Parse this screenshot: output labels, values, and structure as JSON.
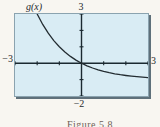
{
  "figure": {
    "caption": "Figure 5.8"
  },
  "chart_data": {
    "type": "line",
    "function_label": "g(x)",
    "xlim": [
      -3,
      3
    ],
    "ylim": [
      -2,
      3
    ],
    "window_labels": {
      "top": "3",
      "bottom": "−2",
      "left": "−3",
      "right": "3"
    },
    "grid": false,
    "legend": "none",
    "series": [
      {
        "name": "g",
        "x": [
          -2,
          -1.75,
          -1.5,
          -1.25,
          -1,
          -0.75,
          -0.5,
          -0.25,
          0,
          0.25,
          0.5,
          0.75,
          1,
          1.25,
          1.5,
          1.75,
          2,
          2.25,
          2.5,
          2.75,
          3
        ],
        "y": [
          3,
          2.364,
          1.828,
          1.378,
          1,
          0.682,
          0.414,
          0.189,
          0,
          -0.159,
          -0.293,
          -0.405,
          -0.5,
          -0.58,
          -0.646,
          -0.703,
          -0.75,
          -0.79,
          -0.823,
          -0.851,
          -0.875
        ]
      }
    ],
    "colors": {
      "plot_background": "#d9ecf4",
      "frame_border": "#8ba3af",
      "frame_shadow": "#5f707a",
      "axis": "#1b2930",
      "curve": "#232c31",
      "label_text": "#24292c",
      "caption_text": "#6e6057",
      "page_background": "#f8f6f1"
    }
  }
}
